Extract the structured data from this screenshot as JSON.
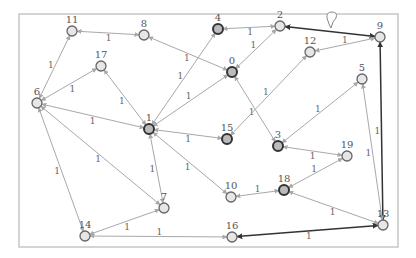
{
  "graph": {
    "title": "",
    "frame": {
      "x": 19,
      "y": 14,
      "w": 379,
      "h": 233
    },
    "colors": {
      "edge": "#a8a8a8",
      "edge_dark": "#333333",
      "node_fill": "#e6e6e6",
      "node_stroke": "#666666",
      "node_highlight": "#333333"
    },
    "nodes": [
      {
        "id": "0",
        "x": 232,
        "y": 72,
        "highlight": true
      },
      {
        "id": "1",
        "x": 149,
        "y": 129,
        "highlight": true
      },
      {
        "id": "2",
        "x": 280,
        "y": 26,
        "highlight": false
      },
      {
        "id": "3",
        "x": 278,
        "y": 146,
        "highlight": true
      },
      {
        "id": "4",
        "x": 218,
        "y": 29,
        "highlight": true
      },
      {
        "id": "5",
        "x": 362,
        "y": 79,
        "highlight": false
      },
      {
        "id": "6",
        "x": 37,
        "y": 103,
        "highlight": false
      },
      {
        "id": "7",
        "x": 164,
        "y": 208,
        "highlight": false
      },
      {
        "id": "8",
        "x": 144,
        "y": 35,
        "highlight": false
      },
      {
        "id": "9",
        "x": 380,
        "y": 37,
        "highlight": false
      },
      {
        "id": "10",
        "x": 231,
        "y": 197,
        "highlight": false
      },
      {
        "id": "11",
        "x": 72,
        "y": 31,
        "highlight": false
      },
      {
        "id": "12",
        "x": 310,
        "y": 52,
        "highlight": false
      },
      {
        "id": "13",
        "x": 383,
        "y": 225,
        "highlight": false
      },
      {
        "id": "14",
        "x": 85,
        "y": 236,
        "highlight": false
      },
      {
        "id": "15",
        "x": 227,
        "y": 139,
        "highlight": true
      },
      {
        "id": "16",
        "x": 232,
        "y": 237,
        "highlight": false
      },
      {
        "id": "17",
        "x": 101,
        "y": 66,
        "highlight": false
      },
      {
        "id": "18",
        "x": 284,
        "y": 190,
        "highlight": true
      },
      {
        "id": "19",
        "x": 347,
        "y": 156,
        "highlight": false
      }
    ],
    "edges": [
      {
        "from": "11",
        "to": "8",
        "weight": "1",
        "dark": false
      },
      {
        "from": "11",
        "to": "6",
        "weight": "1",
        "dark": false
      },
      {
        "from": "6",
        "to": "17",
        "weight": "1",
        "dark": false
      },
      {
        "from": "17",
        "to": "1",
        "weight": "1",
        "dark": false
      },
      {
        "from": "6",
        "to": "1",
        "weight": "1",
        "dark": false
      },
      {
        "from": "6",
        "to": "7",
        "weight": "1",
        "dark": false
      },
      {
        "from": "6",
        "to": "14",
        "weight": "1",
        "dark": false
      },
      {
        "from": "8",
        "to": "0",
        "weight": "1",
        "dark": false
      },
      {
        "from": "4",
        "to": "1",
        "weight": "1",
        "dark": false
      },
      {
        "from": "4",
        "to": "2",
        "weight": "1",
        "dark": false
      },
      {
        "from": "2",
        "to": "0",
        "weight": "1",
        "dark": false
      },
      {
        "from": "2",
        "to": "9",
        "weight": "",
        "dark": true
      },
      {
        "from": "9",
        "to": "12",
        "weight": "1",
        "dark": false
      },
      {
        "from": "9",
        "to": "13",
        "weight": "1",
        "dark": true
      },
      {
        "from": "0",
        "to": "1",
        "weight": "1",
        "dark": false
      },
      {
        "from": "0",
        "to": "3",
        "weight": "1",
        "dark": false
      },
      {
        "from": "12",
        "to": "15",
        "weight": "1",
        "dark": false
      },
      {
        "from": "1",
        "to": "15",
        "weight": "1",
        "dark": false
      },
      {
        "from": "1",
        "to": "7",
        "weight": "1",
        "dark": false
      },
      {
        "from": "1",
        "to": "10",
        "weight": "1",
        "dark": false
      },
      {
        "from": "5",
        "to": "3",
        "weight": "1",
        "dark": false
      },
      {
        "from": "5",
        "to": "13",
        "weight": "1",
        "dark": false
      },
      {
        "from": "3",
        "to": "19",
        "weight": "1",
        "dark": false
      },
      {
        "from": "19",
        "to": "18",
        "weight": "1",
        "dark": false
      },
      {
        "from": "18",
        "to": "10",
        "weight": "1",
        "dark": false
      },
      {
        "from": "18",
        "to": "13",
        "weight": "1",
        "dark": false
      },
      {
        "from": "14",
        "to": "7",
        "weight": "1",
        "dark": false
      },
      {
        "from": "16",
        "to": "14",
        "weight": "1",
        "dark": false
      },
      {
        "from": "16",
        "to": "13",
        "weight": "1",
        "dark": true
      }
    ],
    "cursor": {
      "x": 331,
      "y": 16
    }
  }
}
